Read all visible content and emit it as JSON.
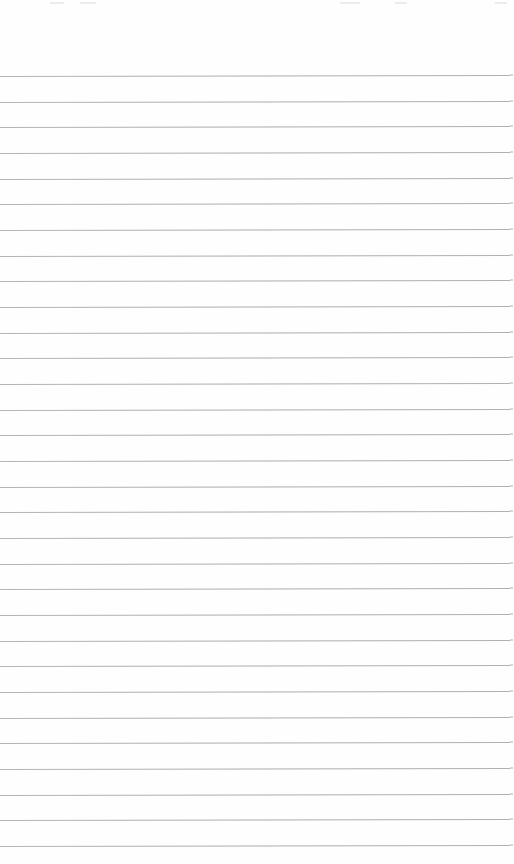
{
  "page": {
    "type": "ruled-paper",
    "background_color": "#fefefe",
    "line_color": "#9f9f9f",
    "line_count": 31,
    "first_line_y": 76,
    "line_spacing": 25.67,
    "line_width": 510,
    "text_content": ""
  }
}
